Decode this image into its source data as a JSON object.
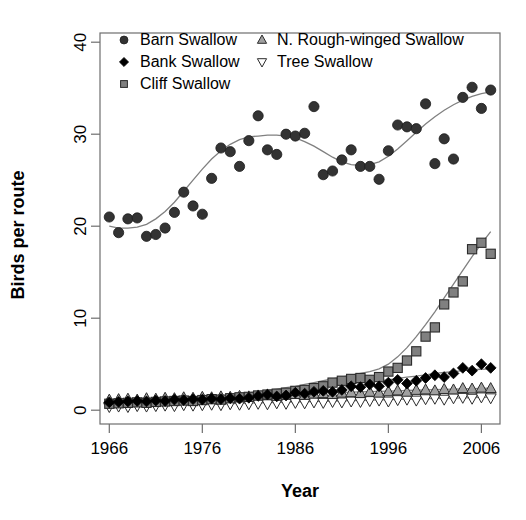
{
  "chart_data": {
    "type": "scatter",
    "title": "",
    "xlabel": "Year",
    "ylabel": "Birds per route",
    "xlim": [
      1965,
      2008
    ],
    "ylim": [
      -1.5,
      41
    ],
    "xticks": [
      1966,
      1976,
      1986,
      1996,
      2006
    ],
    "xticklabels": [
      "1966",
      "1976",
      "1986",
      "1996",
      "2006"
    ],
    "yticks": [
      0,
      10,
      20,
      30,
      40
    ],
    "yticklabels": [
      "0",
      "10",
      "20",
      "30",
      "40"
    ],
    "grid": false,
    "legend_position": "top-left",
    "legend_entries": [
      {
        "label": "Barn Swallow",
        "marker": "filled-circle",
        "color": "#333333"
      },
      {
        "label": "Bank Swallow",
        "marker": "filled-diamond",
        "color": "#000000"
      },
      {
        "label": "Cliff Swallow",
        "marker": "filled-square",
        "color": "#808080"
      },
      {
        "label": "N. Rough-winged Swallow",
        "marker": "triangle-up",
        "color": "#a0a0a0"
      },
      {
        "label": "Tree Swallow",
        "marker": "triangle-down",
        "color": "#ffffff"
      }
    ],
    "x": [
      1966,
      1967,
      1968,
      1969,
      1970,
      1971,
      1972,
      1973,
      1974,
      1975,
      1976,
      1977,
      1978,
      1979,
      1980,
      1981,
      1982,
      1983,
      1984,
      1985,
      1986,
      1987,
      1988,
      1989,
      1990,
      1991,
      1992,
      1993,
      1994,
      1995,
      1996,
      1997,
      1998,
      1999,
      2000,
      2001,
      2002,
      2003,
      2004,
      2005,
      2006,
      2007
    ],
    "series": [
      {
        "name": "Barn Swallow",
        "marker": "filled-circle",
        "color": "#333333",
        "values": [
          21.0,
          19.3,
          20.8,
          20.9,
          18.9,
          19.1,
          19.8,
          21.5,
          23.7,
          22.2,
          21.3,
          25.2,
          28.5,
          28.1,
          26.5,
          29.3,
          32.0,
          28.3,
          27.8,
          30.0,
          29.8,
          30.1,
          33.0,
          25.6,
          26.0,
          27.2,
          28.3,
          26.5,
          26.5,
          25.1,
          28.2,
          31.0,
          30.8,
          30.6,
          33.3,
          26.8,
          29.5,
          27.3,
          34.0,
          35.1,
          32.8,
          34.8
        ],
        "trend": [
          20.0,
          19.8,
          19.8,
          19.9,
          20.2,
          20.8,
          21.6,
          22.6,
          23.8,
          25.0,
          26.2,
          27.3,
          28.2,
          28.9,
          29.4,
          29.7,
          29.8,
          29.9,
          29.9,
          29.8,
          29.6,
          29.2,
          28.7,
          28.1,
          27.5,
          27.0,
          26.7,
          26.6,
          26.7,
          27.0,
          27.6,
          28.4,
          29.3,
          30.2,
          31.1,
          31.9,
          32.6,
          33.2,
          33.7,
          34.1,
          34.4,
          34.6
        ]
      },
      {
        "name": "Bank Swallow",
        "marker": "filled-diamond",
        "color": "#000000",
        "values": [
          0.85,
          0.9,
          0.95,
          1.0,
          0.95,
          1.05,
          1.0,
          1.15,
          1.1,
          1.2,
          1.15,
          1.25,
          1.2,
          1.3,
          1.25,
          1.35,
          1.55,
          1.7,
          1.5,
          1.6,
          1.9,
          1.8,
          2.0,
          2.1,
          2.0,
          2.2,
          2.6,
          2.5,
          2.8,
          2.6,
          3.0,
          3.3,
          2.9,
          3.2,
          3.5,
          3.8,
          3.6,
          4.0,
          4.6,
          4.3,
          5.0,
          4.6
        ],
        "trend": [
          0.9,
          0.95,
          1.0,
          1.05,
          1.1,
          1.15,
          1.2,
          1.25,
          1.3,
          1.35,
          1.4,
          1.45,
          1.5,
          1.6,
          1.7,
          1.8,
          1.9,
          2.0,
          2.1,
          2.2,
          2.3,
          2.4,
          2.5,
          2.6,
          2.7,
          2.8,
          2.9,
          3.0,
          3.1,
          3.2,
          3.3,
          3.45,
          3.6,
          3.7,
          3.85,
          4.0,
          4.1,
          4.2,
          4.3,
          4.4,
          4.45,
          4.5
        ]
      },
      {
        "name": "Cliff Swallow",
        "marker": "filled-square",
        "color": "#808080",
        "values": [
          0.7,
          0.75,
          0.8,
          0.85,
          0.8,
          0.9,
          0.95,
          1.0,
          1.05,
          1.0,
          1.1,
          1.2,
          1.15,
          1.3,
          1.4,
          1.45,
          1.6,
          1.7,
          1.8,
          1.9,
          2.1,
          2.2,
          2.4,
          2.6,
          3.0,
          3.2,
          3.4,
          3.5,
          3.3,
          3.6,
          4.2,
          4.6,
          5.4,
          6.4,
          8.0,
          9.0,
          11.5,
          12.8,
          14.0,
          17.5,
          18.2,
          17.0
        ],
        "trend": [
          0.75,
          0.8,
          0.85,
          0.9,
          0.95,
          1.0,
          1.05,
          1.1,
          1.15,
          1.2,
          1.3,
          1.4,
          1.5,
          1.6,
          1.75,
          1.9,
          2.0,
          2.15,
          2.3,
          2.45,
          2.6,
          2.8,
          3.0,
          3.2,
          3.4,
          3.6,
          3.8,
          4.0,
          4.2,
          4.5,
          5.0,
          5.8,
          6.8,
          8.0,
          9.3,
          10.7,
          12.2,
          13.7,
          15.2,
          16.7,
          18.1,
          19.4
        ]
      },
      {
        "name": "N. Rough-winged Swallow",
        "marker": "triangle-up",
        "color": "#a0a0a0",
        "values": [
          1.1,
          1.15,
          1.2,
          1.1,
          1.25,
          1.2,
          1.3,
          1.25,
          1.35,
          1.3,
          1.4,
          1.35,
          1.45,
          1.4,
          1.5,
          1.45,
          1.55,
          1.6,
          1.5,
          1.65,
          1.7,
          1.6,
          1.75,
          1.8,
          1.7,
          1.85,
          1.9,
          1.8,
          1.95,
          1.85,
          2.0,
          2.1,
          1.95,
          2.15,
          2.2,
          2.1,
          2.25,
          2.2,
          2.35,
          2.3,
          2.4,
          2.35
        ],
        "trend": [
          1.1,
          1.15,
          1.2,
          1.22,
          1.25,
          1.28,
          1.3,
          1.33,
          1.36,
          1.4,
          1.43,
          1.46,
          1.5,
          1.53,
          1.56,
          1.6,
          1.63,
          1.66,
          1.7,
          1.73,
          1.76,
          1.8,
          1.83,
          1.86,
          1.9,
          1.93,
          1.96,
          2.0,
          2.02,
          2.05,
          2.08,
          2.11,
          2.14,
          2.17,
          2.2,
          2.23,
          2.26,
          2.29,
          2.32,
          2.35,
          2.38,
          2.4
        ]
      },
      {
        "name": "Tree Swallow",
        "marker": "triangle-down",
        "color": "#ffffff",
        "values": [
          0.4,
          0.45,
          0.4,
          0.5,
          0.45,
          0.5,
          0.55,
          0.5,
          0.6,
          0.55,
          0.6,
          0.65,
          0.6,
          0.7,
          0.65,
          0.7,
          0.75,
          0.7,
          0.8,
          0.75,
          0.85,
          0.8,
          0.9,
          0.85,
          0.95,
          0.9,
          1.0,
          0.95,
          1.05,
          1.1,
          1.0,
          1.15,
          1.2,
          1.1,
          1.25,
          1.3,
          1.2,
          1.35,
          1.4,
          1.3,
          1.45,
          1.35
        ],
        "trend": [
          0.4,
          0.43,
          0.45,
          0.48,
          0.5,
          0.53,
          0.55,
          0.58,
          0.6,
          0.62,
          0.65,
          0.67,
          0.7,
          0.72,
          0.75,
          0.77,
          0.8,
          0.82,
          0.85,
          0.87,
          0.9,
          0.92,
          0.95,
          0.97,
          1.0,
          1.02,
          1.05,
          1.07,
          1.1,
          1.12,
          1.15,
          1.17,
          1.2,
          1.22,
          1.25,
          1.27,
          1.3,
          1.32,
          1.35,
          1.37,
          1.4,
          1.42
        ]
      }
    ]
  }
}
